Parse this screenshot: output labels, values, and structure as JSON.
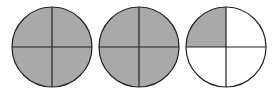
{
  "diagram": {
    "type": "fraction-circles",
    "fill_color": "#a9a9a9",
    "empty_color": "#ffffff",
    "stroke_color": "#222222",
    "circles": [
      {
        "cx": 52,
        "cy": 47,
        "r": 40,
        "parts": 4,
        "shaded": [
          true,
          true,
          true,
          true
        ]
      },
      {
        "cx": 139,
        "cy": 47,
        "r": 40,
        "parts": 4,
        "shaded": [
          true,
          true,
          true,
          true
        ]
      },
      {
        "cx": 226,
        "cy": 47,
        "r": 40,
        "parts": 4,
        "shaded": [
          true,
          false,
          false,
          false
        ]
      }
    ]
  }
}
